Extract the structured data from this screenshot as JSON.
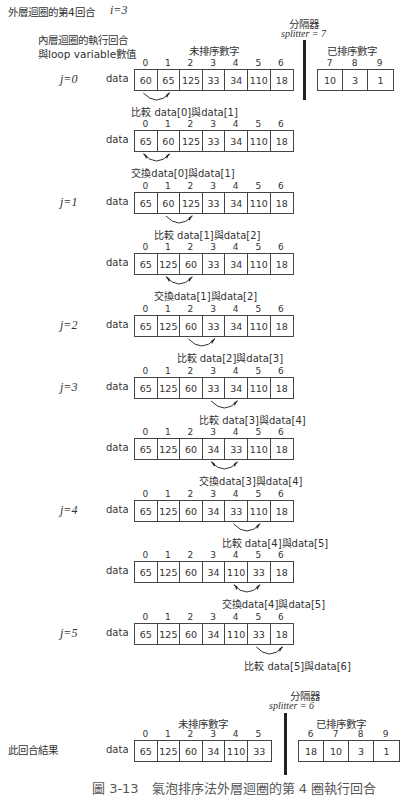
{
  "header": {
    "outer_loop_label": "外層迴圈的第4回合",
    "outer_loop_var": "i=3",
    "inner_loop_label_line1": "內層迴圈的執行回合",
    "inner_loop_label_line2": "與loop variable數值"
  },
  "top_splitter": {
    "title": "分隔器",
    "value": "splitter = 7",
    "unsorted_label": "未排序數字",
    "sorted_label": "已排序數字",
    "sorted_indices": [
      "7",
      "8",
      "9"
    ],
    "sorted_values": [
      "10",
      "3",
      "1"
    ]
  },
  "array_label": "data",
  "indices": [
    "0",
    "1",
    "2",
    "3",
    "4",
    "5",
    "6"
  ],
  "steps": [
    {
      "j": "j=0",
      "values": [
        "60",
        "65",
        "125",
        "33",
        "34",
        "110",
        "18"
      ],
      "op": "compare",
      "pair": [
        0,
        1
      ],
      "caption": "比較 data[0]與data[1]"
    },
    {
      "j": "",
      "values": [
        "65",
        "60",
        "125",
        "33",
        "34",
        "110",
        "18"
      ],
      "op": "swap",
      "pair": [
        0,
        1
      ],
      "caption": "交換data[0]與data[1]"
    },
    {
      "j": "j=1",
      "values": [
        "65",
        "60",
        "125",
        "33",
        "34",
        "110",
        "18"
      ],
      "op": "compare",
      "pair": [
        1,
        2
      ],
      "caption": "比較 data[1]與data[2]"
    },
    {
      "j": "",
      "values": [
        "65",
        "125",
        "60",
        "33",
        "34",
        "110",
        "18"
      ],
      "op": "swap",
      "pair": [
        1,
        2
      ],
      "caption": "交換data[1]與data[2]"
    },
    {
      "j": "j=2",
      "values": [
        "65",
        "125",
        "60",
        "33",
        "34",
        "110",
        "18"
      ],
      "op": "compare",
      "pair": [
        2,
        3
      ],
      "caption": "比較 data[2]與data[3]"
    },
    {
      "j": "j=3",
      "values": [
        "65",
        "125",
        "60",
        "33",
        "34",
        "110",
        "18"
      ],
      "op": "compare",
      "pair": [
        3,
        4
      ],
      "caption": "比較 data[3]與data[4]"
    },
    {
      "j": "",
      "values": [
        "65",
        "125",
        "60",
        "34",
        "33",
        "110",
        "18"
      ],
      "op": "swap",
      "pair": [
        3,
        4
      ],
      "caption": "交換data[3]與data[4]"
    },
    {
      "j": "j=4",
      "values": [
        "65",
        "125",
        "60",
        "34",
        "33",
        "110",
        "18"
      ],
      "op": "compare",
      "pair": [
        4,
        5
      ],
      "caption": "比較 data[4]與data[5]"
    },
    {
      "j": "",
      "values": [
        "65",
        "125",
        "60",
        "34",
        "110",
        "33",
        "18"
      ],
      "op": "swap",
      "pair": [
        4,
        5
      ],
      "caption": "交換data[4]與data[5]"
    },
    {
      "j": "j=5",
      "values": [
        "65",
        "125",
        "60",
        "34",
        "110",
        "33",
        "18"
      ],
      "op": "compare",
      "pair": [
        5,
        6
      ],
      "caption": "比較 data[5]與data[6]"
    }
  ],
  "result": {
    "label": "此回合結果",
    "splitter_title": "分隔器",
    "splitter_value": "splitter = 6",
    "unsorted_label": "未排序數字",
    "sorted_label": "已排序數字",
    "unsorted_indices": [
      "0",
      "1",
      "2",
      "3",
      "4",
      "5"
    ],
    "unsorted_values": [
      "65",
      "125",
      "60",
      "34",
      "110",
      "33"
    ],
    "sorted_indices": [
      "6",
      "7",
      "8",
      "9"
    ],
    "sorted_values": [
      "18",
      "10",
      "3",
      "1"
    ]
  },
  "figure_caption": "圖 3-13　氣泡排序法外層迴圈的第 4 圈執行回合"
}
